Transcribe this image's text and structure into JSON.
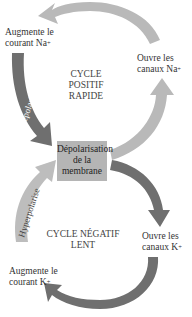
{
  "diagram": {
    "positive_cycle": {
      "title_line1": "CYCLE POSITIF",
      "title_line2": "RAPIDE",
      "step_top_left": {
        "line1": "Augmente le",
        "line2": "courant Na",
        "sup": "+"
      },
      "step_right": {
        "line1": "Ouvre les",
        "line2": "canaux Na",
        "sup": "+"
      },
      "arrow_label": "Dépolarise",
      "colors": {
        "light_arrow": "#b8b8b8",
        "dark_arrow": "#6e6e6e"
      }
    },
    "center": {
      "line1": "Dépolarisation",
      "line2": "de la",
      "line3": "membrane",
      "color": "#b5b5b5"
    },
    "negative_cycle": {
      "title_line1": "CYCLE NÉGATIF",
      "title_line2": "LENT",
      "step_right": {
        "line1": "Ouvre les",
        "line2": "canaux K",
        "sup": "+"
      },
      "step_bottom_left": {
        "line1": "Augmente le",
        "line2": "courant K",
        "sup": "+"
      },
      "arrow_label": "Hyperpolarise",
      "colors": {
        "light_arrow": "#b8b8b8",
        "dark_arrow": "#6e6e6e"
      }
    }
  }
}
